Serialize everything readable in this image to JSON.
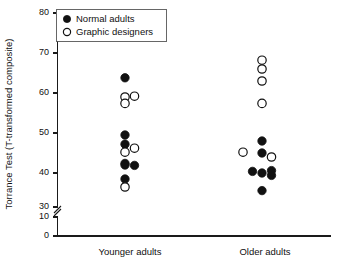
{
  "chart_data": {
    "type": "scatter",
    "title": "",
    "xlabel": "",
    "ylabel": "Torrance Test (T-transformed composite)",
    "categories": [
      "Younger adults",
      "Older adults"
    ],
    "ylim": [
      0,
      80
    ],
    "yticks": [
      0,
      10,
      30,
      40,
      50,
      60,
      70,
      80
    ],
    "ytick_labels": [
      "0",
      "10",
      "30",
      "40",
      "50",
      "60",
      "70",
      "80"
    ],
    "axis_break": {
      "between": [
        10,
        30
      ],
      "present": true
    },
    "grid": false,
    "legend_position": "top-left",
    "legend": [
      {
        "name": "Normal adults",
        "marker": "filled-circle"
      },
      {
        "name": "Graphic designers",
        "marker": "open-circle"
      }
    ],
    "series": [
      {
        "name": "Normal adults",
        "marker": "filled-circle",
        "points": [
          {
            "category": "Younger adults",
            "offset": 0,
            "value": 63.8
          },
          {
            "category": "Younger adults",
            "offset": 0,
            "value": 49.5
          },
          {
            "category": "Younger adults",
            "offset": 0,
            "value": 47.2
          },
          {
            "category": "Younger adults",
            "offset": 0,
            "value": 42.4
          },
          {
            "category": "Younger adults",
            "offset": 0,
            "value": 42.0
          },
          {
            "category": "Younger adults",
            "offset": 1,
            "value": 41.9
          },
          {
            "category": "Younger adults",
            "offset": 0,
            "value": 38.5
          },
          {
            "category": "Older adults",
            "offset": 0,
            "value": 48.0
          },
          {
            "category": "Older adults",
            "offset": 0,
            "value": 45.0
          },
          {
            "category": "Older adults",
            "offset": -1,
            "value": 40.4
          },
          {
            "category": "Older adults",
            "offset": 0,
            "value": 40.0
          },
          {
            "category": "Older adults",
            "offset": 1,
            "value": 40.6
          },
          {
            "category": "Older adults",
            "offset": 1,
            "value": 39.4
          },
          {
            "category": "Older adults",
            "offset": 0,
            "value": 35.6
          }
        ]
      },
      {
        "name": "Graphic designers",
        "marker": "open-circle",
        "points": [
          {
            "category": "Younger adults",
            "offset": 0,
            "value": 59.0
          },
          {
            "category": "Younger adults",
            "offset": 0,
            "value": 57.4
          },
          {
            "category": "Younger adults",
            "offset": 1,
            "value": 59.2
          },
          {
            "category": "Younger adults",
            "offset": 1,
            "value": 46.2
          },
          {
            "category": "Younger adults",
            "offset": 0,
            "value": 45.2
          },
          {
            "category": "Younger adults",
            "offset": 0,
            "value": 36.5
          },
          {
            "category": "Older adults",
            "offset": 0,
            "value": 68.2
          },
          {
            "category": "Older adults",
            "offset": 0,
            "value": 66.0
          },
          {
            "category": "Older adults",
            "offset": 0,
            "value": 63.0
          },
          {
            "category": "Older adults",
            "offset": 0,
            "value": 57.4
          },
          {
            "category": "Older adults",
            "offset": -2,
            "value": 45.2
          },
          {
            "category": "Older adults",
            "offset": 1,
            "value": 44.0
          }
        ]
      }
    ]
  },
  "colors": {
    "axis": "#1a1a1a",
    "text": "#111111",
    "marker_filled": "#111111",
    "marker_open_fill": "#ffffff",
    "marker_open_stroke": "#111111",
    "legend_border": "#555555",
    "background": "#ffffff"
  }
}
